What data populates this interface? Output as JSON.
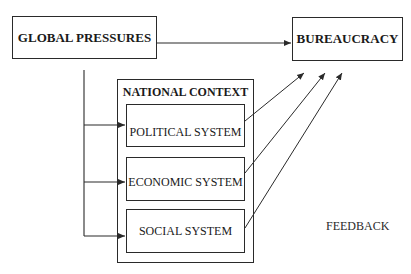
{
  "diagram": {
    "nodes": {
      "global_pressures": "GLOBAL PRESSURES",
      "bureaucracy": "BUREAUCRACY",
      "national_context": "NATIONAL CONTEXT",
      "political_system": "POLITICAL SYSTEM",
      "economic_system": "ECONOMIC SYSTEM",
      "social_system": "SOCIAL SYSTEM"
    },
    "annotations": {
      "feedback": "FEEDBACK"
    },
    "edges": [
      {
        "from": "GLOBAL PRESSURES",
        "to": "BUREAUCRACY"
      },
      {
        "from": "GLOBAL PRESSURES",
        "to": "POLITICAL SYSTEM"
      },
      {
        "from": "GLOBAL PRESSURES",
        "to": "ECONOMIC SYSTEM"
      },
      {
        "from": "GLOBAL PRESSURES",
        "to": "SOCIAL SYSTEM"
      },
      {
        "from": "POLITICAL SYSTEM",
        "to": "BUREAUCRACY"
      },
      {
        "from": "ECONOMIC SYSTEM",
        "to": "BUREAUCRACY"
      },
      {
        "from": "SOCIAL SYSTEM",
        "to": "BUREAUCRACY"
      }
    ],
    "colors": {
      "line": "#2a2a2a",
      "text": "#1a1a1a",
      "background": "#ffffff"
    }
  }
}
